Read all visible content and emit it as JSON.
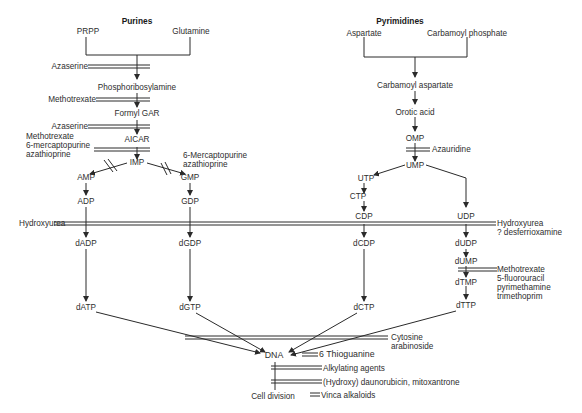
{
  "headings": {
    "purines": "Purines",
    "pyrimidines": "Pyrimidines"
  },
  "purines": {
    "precursors": [
      "PRPP",
      "Glutamine"
    ],
    "phosphoribosylamine": "Phosphoribosylamine",
    "formyl_gar": "Formyl GAR",
    "aicar": "AICAR",
    "imp": "IMP",
    "amp": "AMP",
    "adp": "ADP",
    "dadp": "dADP",
    "datp": "dATP",
    "gmp": "GMP",
    "gdp": "GDP",
    "dgdp": "dGDP",
    "dgtp": "dGTP"
  },
  "pyrimidines": {
    "precursors": [
      "Aspartate",
      "Carbamoyl phosphate"
    ],
    "carbamoyl_aspartate": "Carbamoyl aspartate",
    "orotic_acid": "Orotic acid",
    "omp": "OMP",
    "ump": "UMP",
    "utp": "UTP",
    "ctp": "CTP",
    "cdp": "CDP",
    "dcdp": "dCDP",
    "dctp": "dCTP",
    "udp": "UDP",
    "dudp": "dUDP",
    "dump": "dUMP",
    "dtmp": "dTMP",
    "dttp": "dTTP"
  },
  "end_products": {
    "dna": "DNA",
    "cell_division": "Cell division"
  },
  "inhibitors": {
    "azaserine_1": "Azaserine",
    "methotrexate_1": "Methotrexate",
    "azaserine_2": "Azaserine",
    "aicar_block": [
      "Methotrexate",
      "6-mercaptopurine",
      "azathioprine"
    ],
    "gmp_block": [
      "6-Mercaptopurine",
      "azathioprine"
    ],
    "azauridine": "Azauridine",
    "hydroxyurea_left": "Hydroxyurea",
    "hydroxyurea_right": [
      "Hydroxyurea",
      "? desferrioxamine"
    ],
    "dump_block": [
      "Methotrexate",
      "5-fluorouracil",
      "pyrimethamine",
      "trimethoprim"
    ],
    "cytosine_arabinoside": [
      "Cytosine",
      "arabinoside"
    ],
    "thioguanine": "6 Thioguanine",
    "alkylating": "Alkylating agents",
    "daunorubicin": "(Hydroxy) daunorubicin, mitoxantrone",
    "vinca": "Vinca alkaloids"
  },
  "colors": {
    "line": "#2a2a2a",
    "text": "#2e2e2e",
    "background": "#ffffff"
  }
}
